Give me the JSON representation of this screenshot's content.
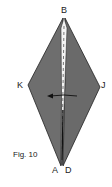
{
  "figure": {
    "caption": "Fig. 10",
    "labels": {
      "top": "B",
      "left": "K",
      "right": "J",
      "bottom_left": "A",
      "bottom_right": "D"
    },
    "colors": {
      "fill": "#6e6e6e",
      "stroke": "#222222",
      "crease": "#ffffff"
    }
  }
}
